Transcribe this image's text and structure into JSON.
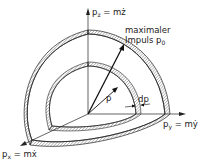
{
  "diagram": {
    "type": "momentum-space-shell",
    "axes": {
      "z": {
        "symbol": "p",
        "subscript": "z",
        "eq": "= mż"
      },
      "y": {
        "symbol": "p",
        "subscript": "y",
        "eq": "= mẏ"
      },
      "x": {
        "symbol": "p",
        "subscript": "x",
        "eq": "= mẋ"
      }
    },
    "labels": {
      "max_line1": "maximaler",
      "max_line2": "Impuls",
      "p0_symbol": "p",
      "p0_subscript": "0",
      "p_label": "p",
      "dp_label": "dp"
    },
    "colors": {
      "line": "#222222",
      "hatch": "#888888",
      "background": "#ffffff"
    }
  }
}
